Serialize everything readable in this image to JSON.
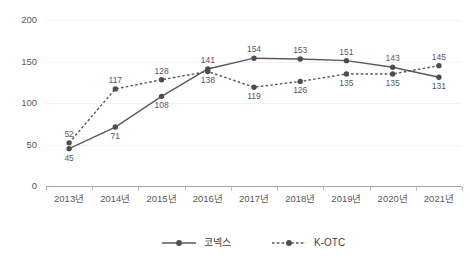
{
  "chart_data": {
    "type": "line",
    "title": "",
    "subtitle": "",
    "xlabel": "",
    "ylabel": "",
    "categories": [
      "2013년",
      "2014년",
      "2015년",
      "2016년",
      "2017년",
      "2018년",
      "2019년",
      "2020년",
      "2021년"
    ],
    "series": [
      {
        "name": "코넥스",
        "style": "solid",
        "color": "#595959",
        "values": [
          45,
          71,
          108,
          141,
          154,
          153,
          151,
          143,
          131
        ],
        "labels": [
          "45",
          "71",
          "108",
          "141",
          "154",
          "153",
          "151",
          "143",
          "131"
        ],
        "label_positions": [
          "below",
          "below",
          "below",
          "above",
          "above",
          "above",
          "above",
          "above",
          "below"
        ]
      },
      {
        "name": "K-OTC",
        "style": "dotted",
        "color": "#595959",
        "values": [
          52,
          117,
          128,
          138,
          119,
          126,
          135,
          135,
          145
        ],
        "labels": [
          "52",
          "117",
          "128",
          "138",
          "119",
          "126",
          "135",
          "135",
          "145"
        ],
        "label_positions": [
          "above",
          "above",
          "above",
          "below",
          "below",
          "below",
          "below",
          "below",
          "above"
        ]
      }
    ],
    "ylim": [
      0,
      200
    ],
    "yticks": [
      0,
      50,
      100,
      150,
      200
    ],
    "ytick_labels": [
      "0",
      "50",
      "100",
      "150",
      "200"
    ],
    "grid": true,
    "grid_color": "#f2f2f2",
    "axis_color": "#a6a6a6",
    "legend_position": "bottom",
    "legend_entries": [
      {
        "label": "코넥스",
        "style": "solid"
      },
      {
        "label": "K-OTC",
        "style": "dotted"
      }
    ]
  }
}
